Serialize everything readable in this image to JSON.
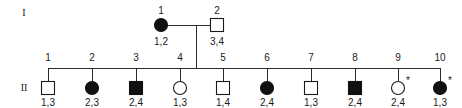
{
  "diagram": {
    "kind": "pedigree-chart",
    "background_color": "#ffffff",
    "stroke_color": "#2b2b2b",
    "symbol_fill_affected": "#111111",
    "symbol_fill_unaffected": "#ffffff",
    "generation_labels": [
      {
        "id": "gen-I",
        "label": "I"
      },
      {
        "id": "gen-II",
        "label": "II"
      }
    ]
  },
  "generation_I": {
    "label": "I",
    "individuals": [
      {
        "number": "1",
        "shape": "circle",
        "status": "filled",
        "genotype": "1,2",
        "asterisk": ""
      },
      {
        "number": "2",
        "shape": "square",
        "status": "open",
        "genotype": "3,4",
        "asterisk": ""
      }
    ]
  },
  "generation_II": {
    "label": "II",
    "individuals": [
      {
        "number": "1",
        "shape": "square",
        "status": "open",
        "genotype": "1,3",
        "asterisk": ""
      },
      {
        "number": "2",
        "shape": "circle",
        "status": "filled",
        "genotype": "2,3",
        "asterisk": ""
      },
      {
        "number": "3",
        "shape": "square",
        "status": "filled",
        "genotype": "2,4",
        "asterisk": ""
      },
      {
        "number": "4",
        "shape": "circle",
        "status": "open",
        "genotype": "1,3",
        "asterisk": ""
      },
      {
        "number": "5",
        "shape": "square",
        "status": "open",
        "genotype": "1,4",
        "asterisk": ""
      },
      {
        "number": "6",
        "shape": "circle",
        "status": "filled",
        "genotype": "2,4",
        "asterisk": ""
      },
      {
        "number": "7",
        "shape": "square",
        "status": "open",
        "genotype": "1,3",
        "asterisk": ""
      },
      {
        "number": "8",
        "shape": "square",
        "status": "filled",
        "genotype": "2,4",
        "asterisk": ""
      },
      {
        "number": "9",
        "shape": "circle",
        "status": "open",
        "genotype": "2,4",
        "asterisk": "*"
      },
      {
        "number": "10",
        "shape": "circle",
        "status": "filled",
        "genotype": "1,3",
        "asterisk": "*"
      }
    ]
  }
}
